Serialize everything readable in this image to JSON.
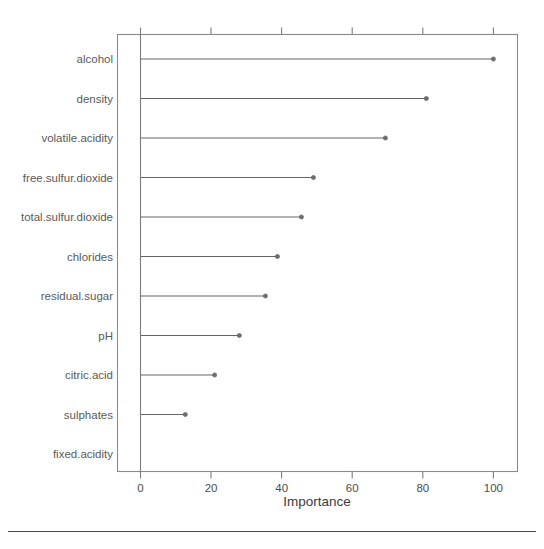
{
  "chart_data": {
    "type": "bar",
    "title": "",
    "subtitle": "",
    "xlabel": "Importance",
    "ylabel": "",
    "xlim": [
      0,
      107
    ],
    "ylim": [
      0,
      12
    ],
    "grid": false,
    "legend": null,
    "orientation": "horizontal",
    "style": "lollipop / dotchart with horizontal needles and endpoint dots",
    "xticks": [
      0,
      20,
      40,
      60,
      80,
      100
    ],
    "xtick_labels": [
      "0",
      "20",
      "40",
      "60",
      "80",
      "100"
    ],
    "categories": [
      "alcohol",
      "density",
      "volatile.acidity",
      "free.sulfur.dioxide",
      "total.sulfur.dioxide",
      "chlorides",
      "residual.sugar",
      "pH",
      "citric.acid",
      "sulphates",
      "fixed.acidity"
    ],
    "values": [
      100,
      81,
      69.4,
      49,
      45.6,
      38.8,
      35.4,
      28,
      21,
      12.7,
      0
    ],
    "annotations": []
  },
  "colors": {
    "needle": "#666666",
    "dot": "#6e6e6e",
    "frame": "#8a8a8a",
    "tick": "#7d7d7d",
    "label_text": "#5a5a5a",
    "tick_text": "#4d4d4d",
    "axis_title_text": "#3d3d3d",
    "footer_rule": "#4a4a4a",
    "background": "#ffffff"
  },
  "footer": {
    "rule_visible": "true"
  }
}
